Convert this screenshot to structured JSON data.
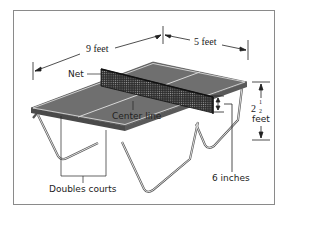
{
  "diagram": {
    "labels": {
      "length": "9 feet",
      "width": "5 feet",
      "net": "Net",
      "center_line": "Center line",
      "height_whole": "2",
      "height_num": "1",
      "height_den": "2",
      "height_unit": "feet",
      "net_height": "6 inches",
      "doubles": "Doubles courts"
    },
    "colors": {
      "table_surface": "#6f6f6f",
      "table_edge": "#4a4a4a",
      "lines": "#d8d8d8",
      "frame_border": "#8a8a8a",
      "text": "#222222"
    }
  }
}
